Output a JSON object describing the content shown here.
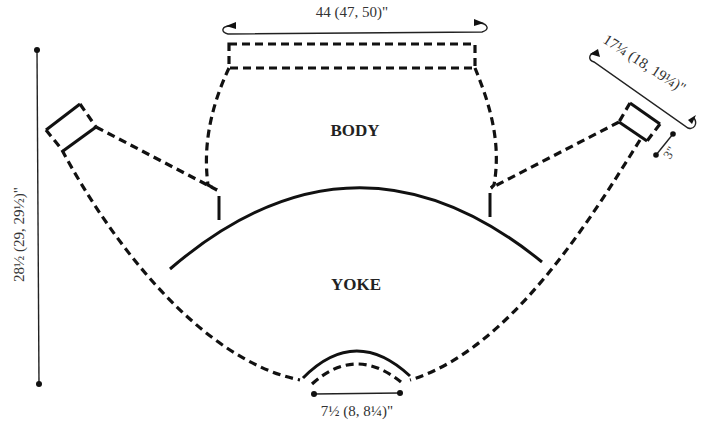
{
  "diagram": {
    "type": "knitting-schematic",
    "sections": {
      "body": "BODY",
      "yoke": "YOKE"
    },
    "measurements": {
      "body_width": "44 (47, 50)\"",
      "sleeve_length": "17¼ (18, 19¼)\"",
      "cuff_depth": "3\"",
      "total_length": "28½ (29, 29½)\"",
      "neck_width": "7½ (8, 8¼)\""
    },
    "colors": {
      "line": "#111111",
      "text": "#333333",
      "background": "#ffffff"
    }
  }
}
